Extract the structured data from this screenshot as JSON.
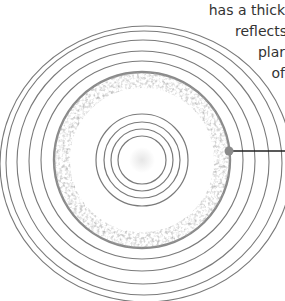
{
  "diagram": {
    "caption_lines": [
      "has a thick",
      "reflects",
      "plar",
      "of"
    ],
    "colors": {
      "ring": "#7a7a7a",
      "disk_edge": "#8a8a8a",
      "debris": "#6e6e6e",
      "callout_line": "#222222",
      "callout_dot": "#8a8a8a",
      "core": "#eeeeee"
    },
    "center": {
      "x": 142,
      "y": 160
    },
    "outer_rings": [
      {
        "rx": 146,
        "ry": 138,
        "cx": 146,
        "cy": 164
      },
      {
        "rx": 134,
        "ry": 128,
        "cx": 144,
        "cy": 162
      },
      {
        "rx": 120,
        "ry": 116,
        "cx": 143,
        "cy": 161
      },
      {
        "rx": 107,
        "ry": 104,
        "cx": 142,
        "cy": 160
      }
    ],
    "disk": {
      "r": 88
    },
    "inner_rings": [
      35,
      29,
      23,
      17
    ],
    "callout": {
      "dot_x": 229,
      "dot_y": 151,
      "end_x": 285
    }
  }
}
